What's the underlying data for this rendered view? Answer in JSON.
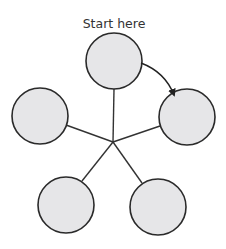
{
  "diagram": {
    "start_label": "Start here",
    "hub": {
      "x": 113,
      "y": 142
    },
    "nodes": [
      {
        "id": "top",
        "cx": 114,
        "cy": 61,
        "r": 28
      },
      {
        "id": "right",
        "cx": 187,
        "cy": 117,
        "r": 28
      },
      {
        "id": "bottom-right",
        "cx": 158,
        "cy": 207,
        "r": 28
      },
      {
        "id": "bottom-left",
        "cx": 66,
        "cy": 205,
        "r": 28
      },
      {
        "id": "left",
        "cx": 40,
        "cy": 116,
        "r": 28
      }
    ],
    "arrow": {
      "from": "top",
      "to": "right",
      "direction": "clockwise"
    },
    "colors": {
      "node_fill": "#e6e6e8",
      "stroke": "#2a2a2a"
    }
  }
}
